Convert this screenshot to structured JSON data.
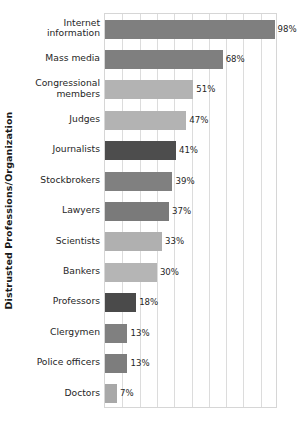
{
  "chart_data": {
    "type": "bar",
    "orientation": "horizontal",
    "title": "",
    "xlabel": "",
    "ylabel": "Distrusted Professions/Organization",
    "xlim": [
      0,
      100
    ],
    "grid": true,
    "gridline_step": 10,
    "legend": "none",
    "value_suffix": "%",
    "categories": [
      "Internet information",
      "Mass media",
      "Congressional members",
      "Judges",
      "Journalists",
      "Stockbrokers",
      "Lawyers",
      "Scientists",
      "Bankers",
      "Professors",
      "Clergymen",
      "Police officers",
      "Doctors"
    ],
    "category_lines": [
      [
        "Internet",
        "information"
      ],
      [
        "Mass media"
      ],
      [
        "Congressional",
        "members"
      ],
      [
        "Judges"
      ],
      [
        "Journalists"
      ],
      [
        "Stockbrokers"
      ],
      [
        "Lawyers"
      ],
      [
        "Scientists"
      ],
      [
        "Bankers"
      ],
      [
        "Professors"
      ],
      [
        "Clergymen"
      ],
      [
        "Police officers"
      ],
      [
        "Doctors"
      ]
    ],
    "values": [
      98,
      68,
      51,
      47,
      41,
      39,
      37,
      33,
      30,
      18,
      13,
      13,
      7
    ],
    "value_labels": [
      "98%",
      "68%",
      "51%",
      "47%",
      "41%",
      "39%",
      "37%",
      "33%",
      "30%",
      "18%",
      "13%",
      "13%",
      "7%"
    ],
    "bar_colors": [
      "#7f7f7f",
      "#7f7f7f",
      "#b3b3b3",
      "#b3b3b3",
      "#4d4d4d",
      "#808080",
      "#7a7a7a",
      "#b0b0b0",
      "#b5b5b5",
      "#4a4a4a",
      "#808080",
      "#7d7d7d",
      "#a8a8a8"
    ]
  },
  "colors": {
    "background": "#ffffff",
    "gridline": "#dcdcdc",
    "plot_border": "#d6d6d6",
    "text": "#262626",
    "axis_title": "#1a1a1a"
  }
}
